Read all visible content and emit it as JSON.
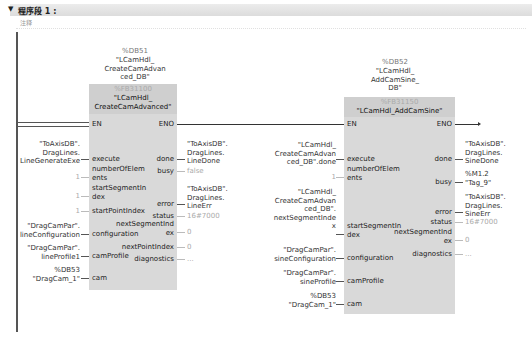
{
  "network": {
    "title": "程序段 1 :",
    "comment": "注释",
    "toggle": "▼"
  },
  "blocks": [
    {
      "instance_addr": "%DB51",
      "instance_name": "\"LCamHdl_\nCreateCamAdvan\nced_DB\"",
      "fb_addr": "%FB31100",
      "fb_name": "\"LCamHdl_\nCreateCamAdvanced\"",
      "en": "EN",
      "eno": "ENO",
      "inputs": [
        {
          "pin": "execute",
          "value": "\"ToAxisDB\".\nDragLines.\nLineGenerateExe"
        },
        {
          "pin": "numberOfElem\nents",
          "value": "1"
        },
        {
          "pin": "startSegmentIn\ndex",
          "value": "1"
        },
        {
          "pin": "startPointIndex",
          "value": "1"
        },
        {
          "pin": "configuration",
          "value": "\"DragCamPar\".\nlineConfiguration"
        },
        {
          "pin": "camProfile",
          "value": "\"DragCamPar\".\nlineProfile1"
        },
        {
          "pin": "cam",
          "value": "%DB53\n\"DragCam_1\""
        }
      ],
      "outputs": [
        {
          "pin": "done",
          "value": "\"ToAxisDB\".\nDragLines.\nLineDone"
        },
        {
          "pin": "busy",
          "value": "false"
        },
        {
          "pin": "error",
          "value": "\"ToAxisDB\".\nDragLines.\nLineErr"
        },
        {
          "pin": "status",
          "value": "16#7000"
        },
        {
          "pin": "nextSegmentInd\nex",
          "value": "0"
        },
        {
          "pin": "nextPointIndex",
          "value": "0"
        },
        {
          "pin": "diagnostics",
          "value": "..."
        }
      ]
    },
    {
      "instance_addr": "%DB52",
      "instance_name": "\"LCamHdl_\nAddCamSine_\nDB\"",
      "fb_addr": "%FB31150",
      "fb_name": "\"LCamHdl_AddCamSine\"",
      "en": "EN",
      "eno": "ENO",
      "inputs": [
        {
          "pin": "execute",
          "value": "\"LCamHdl_\nCreateCamAdvan\nced_DB\".done"
        },
        {
          "pin": "numberOfElem\nents",
          "value": "1"
        },
        {
          "pin": "startSegmentIn\ndex",
          "value": "\"LCamHdl_\nCreateCamAdvan\nced_DB\".\nnextSegmentInde\nx"
        },
        {
          "pin": "configuration",
          "value": "\"DragCamPar\".\nsineConfiguration"
        },
        {
          "pin": "camProfile",
          "value": "\"DragCamPar\".\nsineProfile"
        },
        {
          "pin": "cam",
          "value": "%DB53\n\"DragCam_1\""
        }
      ],
      "outputs": [
        {
          "pin": "done",
          "value": "\"ToAxisDB\".\nDragLines.\nSineDone"
        },
        {
          "pin": "busy",
          "value": "%M1.2\n\"Tag_9\""
        },
        {
          "pin": "error",
          "value": "\"ToAxisDB\".\nDragLines.\nSineErr"
        },
        {
          "pin": "status",
          "value": "16#7000"
        },
        {
          "pin": "nextSegmentInd\nex",
          "value": "0"
        },
        {
          "pin": "diagnostics",
          "value": "..."
        }
      ]
    }
  ],
  "colors": {
    "block_fill": "#d9d9d9",
    "header_fill": "#cfcfcf",
    "wire": "#333333",
    "grayed_value": "#aaaaaa"
  }
}
